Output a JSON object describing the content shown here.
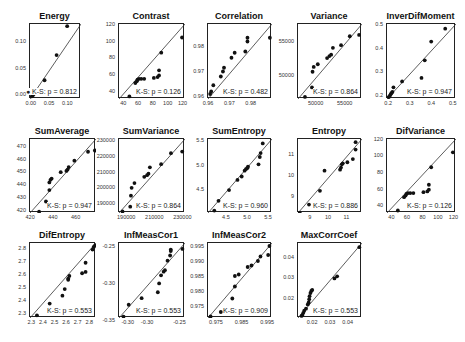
{
  "chart_data": [
    {
      "type": "scatter",
      "title": "Energy",
      "ks_label": "K-S: p = 0.812",
      "xlim": [
        -0.005,
        0.135
      ],
      "ylim": [
        -0.005,
        0.135
      ],
      "xticks": [
        0.0,
        0.05,
        0.1
      ],
      "xtick_labels": [
        "0.00",
        "0.05",
        "0.10"
      ],
      "yticks": [
        0.0,
        0.05,
        0.1
      ],
      "ytick_labels": [
        "0.00",
        "0.05",
        "0.10"
      ],
      "points": [
        [
          0.0,
          0.0
        ],
        [
          0.003,
          0.002
        ],
        [
          0.006,
          0.005
        ],
        [
          0.01,
          0.008
        ],
        [
          0.035,
          0.03
        ],
        [
          0.035,
          0.01
        ],
        [
          0.068,
          0.077
        ],
        [
          0.097,
          0.131
        ]
      ],
      "reference_line": "y=x",
      "ks_marker": true
    },
    {
      "type": "scatter",
      "title": "Contrast",
      "ks_label": "K-S: p = 0.126",
      "xlim": [
        33,
        122
      ],
      "ylim": [
        33,
        122
      ],
      "xticks": [
        40,
        60,
        80,
        100,
        120
      ],
      "xtick_labels": [
        "40",
        "60",
        "80",
        "100",
        "120"
      ],
      "yticks": [
        40,
        60,
        80,
        100,
        120
      ],
      "ytick_labels": [
        "40",
        "60",
        "80",
        "100",
        "120"
      ],
      "points": [
        [
          47,
          36
        ],
        [
          55,
          52
        ],
        [
          57,
          54
        ],
        [
          58,
          56
        ],
        [
          60,
          57
        ],
        [
          63,
          57
        ],
        [
          67,
          57
        ],
        [
          80,
          58
        ],
        [
          85,
          59
        ],
        [
          87,
          61
        ],
        [
          87,
          67
        ],
        [
          90,
          88
        ],
        [
          118,
          106
        ]
      ],
      "reference_line": "y=x"
    },
    {
      "type": "scatter",
      "title": "Correlation",
      "ks_label": "K-S: p = 0.482",
      "xlim": [
        0.9595,
        0.9895
      ],
      "ylim": [
        0.9595,
        0.9895
      ],
      "xticks": [
        0.96,
        0.97,
        0.98
      ],
      "xtick_labels": [
        "0.96",
        "0.97",
        "0.98"
      ],
      "yticks": [
        0.96,
        0.97,
        0.98
      ],
      "ytick_labels": [
        "0.96",
        "0.97",
        "0.98"
      ],
      "points": [
        [
          0.9605,
          0.9615
        ],
        [
          0.961,
          0.9625
        ],
        [
          0.962,
          0.965
        ],
        [
          0.9655,
          0.9685
        ],
        [
          0.9665,
          0.9705
        ],
        [
          0.967,
          0.972
        ],
        [
          0.9705,
          0.976
        ],
        [
          0.972,
          0.978
        ],
        [
          0.977,
          0.9785
        ],
        [
          0.978,
          0.9825
        ],
        [
          0.978,
          0.984
        ],
        [
          0.9885,
          0.984
        ]
      ],
      "reference_line": "y=x"
    },
    {
      "type": "scatter",
      "title": "Variance",
      "ks_label": "K-S: p = 0.864",
      "xlim": [
        46800,
        57800
      ],
      "ylim": [
        46800,
        57800
      ],
      "xticks": [
        50000,
        55000
      ],
      "xtick_labels": [
        "50000",
        "55000"
      ],
      "yticks": [
        50000,
        55000
      ],
      "ytick_labels": [
        "50000",
        "55000"
      ],
      "points": [
        [
          48000,
          47100
        ],
        [
          49200,
          48500
        ],
        [
          49300,
          50800
        ],
        [
          49500,
          51500
        ],
        [
          50200,
          51900
        ],
        [
          51800,
          52800
        ],
        [
          52200,
          53100
        ],
        [
          52500,
          53300
        ],
        [
          52800,
          54300
        ],
        [
          54200,
          54700
        ],
        [
          55700,
          56000
        ],
        [
          57300,
          56200
        ]
      ],
      "reference_line": "y=x"
    },
    {
      "type": "scatter",
      "title": "InverDifMoment",
      "ks_label": "K-S: p = 0.947",
      "xlim": [
        0.19,
        0.51
      ],
      "ylim": [
        0.19,
        0.51
      ],
      "xticks": [
        0.2,
        0.3,
        0.4,
        0.5
      ],
      "xtick_labels": [
        "0.2",
        "0.3",
        "0.4",
        "0.5"
      ],
      "yticks": [
        0.2,
        0.3,
        0.4,
        0.5
      ],
      "ytick_labels": [
        "0.2",
        "0.3",
        "0.4",
        "0.5"
      ],
      "points": [
        [
          0.198,
          0.198
        ],
        [
          0.203,
          0.203
        ],
        [
          0.207,
          0.21
        ],
        [
          0.21,
          0.215
        ],
        [
          0.215,
          0.22
        ],
        [
          0.22,
          0.24
        ],
        [
          0.26,
          0.265
        ],
        [
          0.35,
          0.28
        ],
        [
          0.365,
          0.355
        ],
        [
          0.395,
          0.435
        ],
        [
          0.46,
          0.49
        ]
      ],
      "reference_line": "y=x"
    },
    {
      "type": "scatter",
      "title": "SumAverage",
      "ks_label": "K-S: p = 0.947",
      "xlim": [
        419,
        477
      ],
      "ylim": [
        419,
        477
      ],
      "xticks": [
        420,
        440,
        460
      ],
      "xtick_labels": [
        "420",
        "440",
        "460"
      ],
      "yticks": [
        420,
        430,
        440,
        450,
        460,
        470
      ],
      "ytick_labels": [
        "420",
        "430",
        "440",
        "450",
        "460",
        "470"
      ],
      "points": [
        [
          427,
          420
        ],
        [
          433,
          428
        ],
        [
          436,
          437
        ],
        [
          436,
          443
        ],
        [
          437,
          445
        ],
        [
          438,
          446
        ],
        [
          446,
          451
        ],
        [
          451,
          452
        ],
        [
          452,
          453
        ],
        [
          453,
          455
        ],
        [
          458,
          460
        ],
        [
          470,
          467
        ],
        [
          476,
          468
        ]
      ],
      "reference_line": "y=x"
    },
    {
      "type": "scatter",
      "title": "SumVariance",
      "ks_label": "K-S: p = 0.864",
      "xlim": [
        185000,
        232000
      ],
      "ylim": [
        185000,
        232000
      ],
      "xticks": [
        190000,
        210000,
        230000
      ],
      "xtick_labels": [
        "190000",
        "210000",
        "230000"
      ],
      "yticks": [
        190000,
        200000,
        210000,
        220000,
        230000
      ],
      "ytick_labels": [
        "190000",
        "200000",
        "210000",
        "220000",
        "230000"
      ],
      "points": [
        [
          187500,
          186000
        ],
        [
          193000,
          189000
        ],
        [
          193500,
          196000
        ],
        [
          194000,
          201000
        ],
        [
          196000,
          204000
        ],
        [
          203000,
          208000
        ],
        [
          205000,
          209000
        ],
        [
          206000,
          210000
        ],
        [
          207000,
          214000
        ],
        [
          215000,
          216000
        ],
        [
          222000,
          223000
        ],
        [
          230000,
          224000
        ]
      ],
      "reference_line": "y=x"
    },
    {
      "type": "scatter",
      "title": "SumEntropy",
      "ks_label": "K-S: p = 0.960",
      "xlim": [
        4.05,
        5.57
      ],
      "ylim": [
        4.05,
        5.57
      ],
      "xticks": [
        4.5,
        5.0,
        5.5
      ],
      "xtick_labels": [
        "4.5",
        "5.0",
        "5.5"
      ],
      "yticks": [
        4.5,
        5.0,
        5.5
      ],
      "ytick_labels": [
        "4.5",
        "5.0",
        "5.5"
      ],
      "points": [
        [
          4.2,
          4.1
        ],
        [
          4.3,
          4.3
        ],
        [
          4.55,
          4.52
        ],
        [
          4.75,
          4.73
        ],
        [
          4.85,
          4.8
        ],
        [
          4.92,
          4.92
        ],
        [
          4.95,
          4.95
        ],
        [
          4.98,
          4.97
        ],
        [
          5.0,
          5.0
        ],
        [
          5.25,
          5.05
        ],
        [
          5.28,
          5.2
        ],
        [
          5.3,
          5.28
        ],
        [
          5.35,
          5.48
        ]
      ],
      "reference_line": "y=x"
    },
    {
      "type": "scatter",
      "title": "Entropy",
      "ks_label": "K-S: p = 0.886",
      "xlim": [
        8.3,
        11.8
      ],
      "ylim": [
        8.3,
        11.8
      ],
      "xticks": [
        9,
        10,
        11
      ],
      "xtick_labels": [
        "9",
        "10",
        "11"
      ],
      "yticks": [
        9,
        10,
        11
      ],
      "ytick_labels": [
        "9",
        "10",
        "11"
      ],
      "points": [
        [
          8.4,
          8.3
        ],
        [
          8.9,
          8.7
        ],
        [
          9.5,
          9.35
        ],
        [
          9.75,
          10.3
        ],
        [
          10.6,
          10.35
        ],
        [
          10.65,
          10.45
        ],
        [
          10.7,
          10.6
        ],
        [
          10.75,
          10.65
        ],
        [
          11.0,
          10.7
        ],
        [
          11.3,
          10.85
        ],
        [
          11.45,
          11.3
        ],
        [
          11.45,
          11.65
        ]
      ],
      "reference_line": "y=x"
    },
    {
      "type": "scatter",
      "title": "DifVariance",
      "ks_label": "K-S: p = 0.126",
      "xlim": [
        33,
        122
      ],
      "ylim": [
        33,
        122
      ],
      "xticks": [
        40,
        60,
        80,
        100,
        120
      ],
      "xtick_labels": [
        "40",
        "60",
        "80",
        "100",
        "120"
      ],
      "yticks": [
        40,
        60,
        80,
        100,
        120
      ],
      "ytick_labels": [
        "40",
        "60",
        "80",
        "100",
        "120"
      ],
      "points": [
        [
          47,
          36
        ],
        [
          55,
          52
        ],
        [
          57,
          54
        ],
        [
          58,
          56
        ],
        [
          60,
          57
        ],
        [
          63,
          57
        ],
        [
          67,
          57
        ],
        [
          80,
          58
        ],
        [
          85,
          59
        ],
        [
          87,
          61
        ],
        [
          87,
          67
        ],
        [
          90,
          88
        ],
        [
          118,
          106
        ]
      ],
      "reference_line": "y=x"
    },
    {
      "type": "scatter",
      "title": "DifEntropy",
      "ks_label": "K-S: p = 0.553",
      "xlim": [
        2.28,
        2.85
      ],
      "ylim": [
        2.28,
        2.85
      ],
      "xticks": [
        2.3,
        2.4,
        2.5,
        2.6,
        2.7,
        2.8
      ],
      "xtick_labels": [
        "2.3",
        "2.4",
        "2.5",
        "2.6",
        "2.7",
        "2.8"
      ],
      "yticks": [
        2.3,
        2.4,
        2.5,
        2.6,
        2.7,
        2.8
      ],
      "ytick_labels": [
        "2.3",
        "2.4",
        "2.5",
        "2.6",
        "2.7",
        "2.8"
      ],
      "points": [
        [
          2.34,
          2.3
        ],
        [
          2.45,
          2.39
        ],
        [
          2.56,
          2.45
        ],
        [
          2.58,
          2.5
        ],
        [
          2.61,
          2.57
        ],
        [
          2.61,
          2.58
        ],
        [
          2.62,
          2.6
        ],
        [
          2.73,
          2.62
        ],
        [
          2.76,
          2.63
        ],
        [
          2.76,
          2.7
        ],
        [
          2.82,
          2.8
        ],
        [
          2.83,
          2.82
        ],
        [
          2.84,
          2.83
        ]
      ],
      "reference_line": "y=x"
    },
    {
      "type": "scatter",
      "title": "InfMeasCor1",
      "ks_label": "K-S: p = 0.553",
      "xlim": [
        -0.345,
        -0.243
      ],
      "ylim": [
        -0.345,
        -0.243
      ],
      "xticks": [
        -0.33,
        -0.3,
        -0.25
      ],
      "xtick_labels": [
        "-0.30",
        "-0.30",
        "-0.25"
      ],
      "yticks": [
        -0.25,
        -0.3,
        -0.35
      ],
      "ytick_labels": [
        "-0.25",
        "-0.30",
        "-0.35"
      ],
      "points": [
        [
          -0.338,
          -0.343
        ],
        [
          -0.33,
          -0.327
        ],
        [
          -0.31,
          -0.318
        ],
        [
          -0.285,
          -0.31
        ],
        [
          -0.283,
          -0.298
        ],
        [
          -0.28,
          -0.287
        ],
        [
          -0.276,
          -0.282
        ],
        [
          -0.274,
          -0.28
        ],
        [
          -0.27,
          -0.267
        ],
        [
          -0.266,
          -0.26
        ],
        [
          -0.265,
          -0.254
        ],
        [
          -0.265,
          -0.252
        ],
        [
          -0.247,
          -0.251
        ]
      ],
      "reference_line": "y=x"
    },
    {
      "type": "scatter",
      "title": "InfMeasCor2",
      "ks_label": "K-S: p = 0.909",
      "xlim": [
        0.9715,
        0.9965
      ],
      "ylim": [
        0.9715,
        0.9965
      ],
      "xticks": [
        0.975,
        0.985,
        0.995
      ],
      "xtick_labels": [
        "0.975",
        "0.985",
        "0.995"
      ],
      "yticks": [
        0.975,
        0.98,
        0.985,
        0.99,
        0.995
      ],
      "ytick_labels": [
        "0.975",
        "0.980",
        "0.985",
        "0.990",
        "0.995"
      ],
      "points": [
        [
          0.9725,
          0.972
        ],
        [
          0.9765,
          0.9735
        ],
        [
          0.981,
          0.978
        ],
        [
          0.982,
          0.982
        ],
        [
          0.982,
          0.9855
        ],
        [
          0.9835,
          0.986
        ],
        [
          0.987,
          0.9885
        ],
        [
          0.9885,
          0.989
        ],
        [
          0.991,
          0.9905
        ],
        [
          0.992,
          0.992
        ],
        [
          0.995,
          0.9925
        ],
        [
          0.9955,
          0.9955
        ]
      ],
      "reference_line": "y=x"
    },
    {
      "type": "scatter",
      "title": "MaxCorrCoef",
      "ks_label": "K-S: p = 0.553",
      "xlim": [
        0.0115,
        0.0475
      ],
      "ylim": [
        0.0115,
        0.0475
      ],
      "xticks": [
        0.02,
        0.03,
        0.04
      ],
      "xtick_labels": [
        "0.02",
        "0.03",
        "0.04"
      ],
      "yticks": [
        0.02,
        0.03,
        0.04
      ],
      "ytick_labels": [
        "0.02",
        "0.03",
        "0.04"
      ],
      "points": [
        [
          0.0135,
          0.0125
        ],
        [
          0.014,
          0.013
        ],
        [
          0.0145,
          0.014
        ],
        [
          0.015,
          0.015
        ],
        [
          0.016,
          0.016
        ],
        [
          0.017,
          0.018
        ],
        [
          0.0175,
          0.019
        ],
        [
          0.0178,
          0.0205
        ],
        [
          0.018,
          0.022
        ],
        [
          0.0185,
          0.0235
        ],
        [
          0.019,
          0.0245
        ],
        [
          0.0195,
          0.025
        ],
        [
          0.032,
          0.0305
        ],
        [
          0.0335,
          0.0315
        ],
        [
          0.046,
          0.0455
        ]
      ],
      "reference_line": "y=x"
    }
  ],
  "layout": {
    "boxes": [
      [
        29,
        23,
        51,
        75
      ],
      [
        118,
        23,
        66,
        75
      ],
      [
        207,
        23,
        64,
        75
      ],
      [
        297,
        23,
        64,
        75
      ],
      [
        386,
        23,
        69,
        75
      ],
      [
        29,
        138,
        66,
        74
      ],
      [
        118,
        138,
        66,
        74
      ],
      [
        207,
        138,
        64,
        74
      ],
      [
        297,
        138,
        64,
        74
      ],
      [
        386,
        138,
        69,
        74
      ],
      [
        29,
        242,
        66,
        75
      ],
      [
        118,
        242,
        66,
        75
      ],
      [
        207,
        242,
        64,
        75
      ],
      [
        297,
        242,
        64,
        75
      ]
    ],
    "colors": {
      "axis": "#222222",
      "point": "#111111",
      "line": "#333333",
      "background": "#ffffff"
    }
  }
}
